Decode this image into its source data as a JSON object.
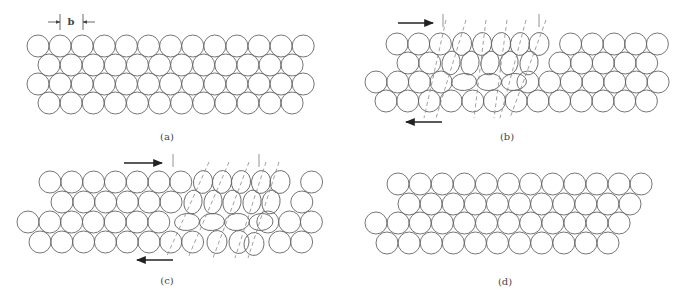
{
  "figure": {
    "panels": [
      {
        "id": "a",
        "label": "(a)",
        "label_pos": [
          167,
          140
        ],
        "radius": 11,
        "spacing": 22.1,
        "rows": [
          {
            "x0": 38,
            "y": 46,
            "count": 13
          },
          {
            "x0": 49,
            "y": 65,
            "count": 12
          },
          {
            "x0": 38,
            "y": 84,
            "count": 13
          },
          {
            "x0": 49,
            "y": 103,
            "count": 12
          }
        ],
        "ellipses": [],
        "dashes": [],
        "arrows": [],
        "ticks": [],
        "dimension": {
          "label": "b",
          "x1": 60,
          "x2": 83,
          "y": 22,
          "label_x": 71
        }
      },
      {
        "id": "b",
        "label": "(b)",
        "label_pos": [
          507,
          140
        ],
        "radius": 11,
        "spacing": 21.7,
        "rows": [
          {
            "x0": 397,
            "y": 44,
            "count": 13,
            "skip": [
              3,
              4,
              5,
              6,
              7
            ]
          },
          {
            "x0": 408,
            "y": 63,
            "count": 12,
            "skip": [
              2,
              3,
              4,
              5,
              6
            ]
          },
          {
            "x0": 376,
            "y": 82,
            "count": 14,
            "skip": [
              4,
              5,
              6
            ]
          },
          {
            "x0": 386,
            "y": 101,
            "count": 13
          }
        ],
        "ellipses": [
          {
            "cx": 462,
            "cy": 44,
            "rx": 9.5,
            "ry": 11.5,
            "rot": 8
          },
          {
            "cx": 482,
            "cy": 44,
            "rx": 9.5,
            "ry": 11.5,
            "rot": 8
          },
          {
            "cx": 501,
            "cy": 44,
            "rx": 9.5,
            "ry": 11.5,
            "rot": 8
          },
          {
            "cx": 520,
            "cy": 44,
            "rx": 9.5,
            "ry": 11.5,
            "rot": 8
          },
          {
            "cx": 539,
            "cy": 44,
            "rx": 10,
            "ry": 11.5,
            "rot": 8
          },
          {
            "cx": 451,
            "cy": 63,
            "rx": 9,
            "ry": 12,
            "rot": 10
          },
          {
            "cx": 470,
            "cy": 63,
            "rx": 9,
            "ry": 12,
            "rot": 10
          },
          {
            "cx": 490,
            "cy": 63,
            "rx": 9,
            "ry": 12,
            "rot": 10
          },
          {
            "cx": 509,
            "cy": 63,
            "rx": 9,
            "ry": 12,
            "rot": 10
          },
          {
            "cx": 529,
            "cy": 63,
            "rx": 9,
            "ry": 12,
            "rot": 10
          },
          {
            "cx": 464,
            "cy": 82,
            "rx": 12.5,
            "ry": 8.5,
            "rot": -5
          },
          {
            "cx": 489,
            "cy": 82,
            "rx": 12.5,
            "ry": 8.5,
            "rot": -5
          },
          {
            "cx": 514,
            "cy": 82,
            "rx": 12.5,
            "ry": 8.5,
            "rot": -5
          }
        ],
        "dashes": [
          [
            446,
            20,
            424,
            118
          ],
          [
            466,
            20,
            436,
            118
          ],
          [
            486,
            20,
            474,
            118
          ],
          [
            507,
            20,
            494,
            118
          ],
          [
            526,
            20,
            500,
            118
          ],
          [
            546,
            20,
            510,
            118
          ]
        ],
        "arrows": [
          {
            "x1": 398,
            "x2": 433,
            "y": 23,
            "dir": "right"
          },
          {
            "x1": 442,
            "x2": 406,
            "y": 122,
            "dir": "left"
          }
        ],
        "ticks": [
          {
            "x": 443,
            "y1": 14,
            "y2": 27
          },
          {
            "x": 539,
            "y1": 14,
            "y2": 27
          }
        ]
      },
      {
        "id": "c",
        "label": "(c)",
        "label_pos": [
          167,
          284
        ],
        "radius": 11,
        "spacing": 21.8,
        "rows": [
          {
            "x0": 50,
            "y": 182,
            "count": 13,
            "skip": [
              7,
              8,
              9,
              10,
              11
            ]
          },
          {
            "x0": 62,
            "y": 202,
            "count": 12,
            "skip": [
              6,
              7,
              8,
              9,
              10
            ]
          },
          {
            "x0": 28,
            "y": 222,
            "count": 14,
            "skip": [
              7,
              8,
              9,
              10
            ]
          },
          {
            "x0": 40,
            "y": 242,
            "count": 13,
            "skip": [
              8,
              9,
              10
            ]
          }
        ],
        "ellipses": [
          {
            "cx": 203,
            "cy": 182,
            "rx": 9.5,
            "ry": 11.5,
            "rot": 8
          },
          {
            "cx": 222,
            "cy": 182,
            "rx": 9.5,
            "ry": 11.5,
            "rot": 8
          },
          {
            "cx": 241,
            "cy": 182,
            "rx": 9.5,
            "ry": 11.5,
            "rot": 8
          },
          {
            "cx": 261,
            "cy": 182,
            "rx": 9.5,
            "ry": 11.5,
            "rot": 8
          },
          {
            "cx": 280,
            "cy": 182,
            "rx": 10,
            "ry": 11.5,
            "rot": 8
          },
          {
            "cx": 193,
            "cy": 202,
            "rx": 9,
            "ry": 12,
            "rot": 10
          },
          {
            "cx": 213,
            "cy": 202,
            "rx": 9,
            "ry": 12,
            "rot": 10
          },
          {
            "cx": 232,
            "cy": 202,
            "rx": 9,
            "ry": 12,
            "rot": 10
          },
          {
            "cx": 252,
            "cy": 202,
            "rx": 9,
            "ry": 12,
            "rot": 10
          },
          {
            "cx": 271,
            "cy": 202,
            "rx": 9,
            "ry": 12,
            "rot": 10
          },
          {
            "cx": 187,
            "cy": 222,
            "rx": 12.5,
            "ry": 8.5,
            "rot": -5
          },
          {
            "cx": 212,
            "cy": 222,
            "rx": 12.5,
            "ry": 8.5,
            "rot": -5
          },
          {
            "cx": 237,
            "cy": 222,
            "rx": 12.5,
            "ry": 8.5,
            "rot": -5
          },
          {
            "cx": 261,
            "cy": 222,
            "rx": 12,
            "ry": 8.5,
            "rot": -5
          },
          {
            "cx": 217,
            "cy": 242,
            "rx": 10,
            "ry": 11.5,
            "rot": 6
          },
          {
            "cx": 239,
            "cy": 242,
            "rx": 10,
            "ry": 11.5,
            "rot": 6
          },
          {
            "cx": 254,
            "cy": 244,
            "rx": 10,
            "ry": 11.5,
            "rot": 6
          }
        ],
        "dashes": [
          [
            209,
            162,
            166,
            258
          ],
          [
            229,
            162,
            188,
            258
          ],
          [
            249,
            162,
            213,
            258
          ],
          [
            266,
            162,
            235,
            258
          ],
          [
            279,
            162,
            248,
            258
          ]
        ],
        "arrows": [
          {
            "x1": 124,
            "x2": 162,
            "y": 163,
            "dir": "right"
          },
          {
            "x1": 173,
            "x2": 137,
            "y": 260,
            "dir": "left"
          }
        ],
        "ticks": [
          {
            "x": 173,
            "y1": 154,
            "y2": 167
          },
          {
            "x": 259,
            "y1": 154,
            "y2": 167
          }
        ]
      },
      {
        "id": "d",
        "label": "(d)",
        "label_pos": [
          505,
          285
        ],
        "radius": 11,
        "spacing": 22.1,
        "rows": [
          {
            "x0": 398,
            "y": 184,
            "count": 12
          },
          {
            "x0": 409,
            "y": 204,
            "count": 11
          },
          {
            "x0": 376,
            "y": 223,
            "count": 12
          },
          {
            "x0": 387,
            "y": 243,
            "count": 11
          }
        ],
        "ellipses": [],
        "dashes": [],
        "arrows": [],
        "ticks": []
      }
    ]
  },
  "labels": {
    "a": "(a)",
    "b": "(b)",
    "c": "(c)",
    "d": "(d)",
    "dimension": "b"
  }
}
